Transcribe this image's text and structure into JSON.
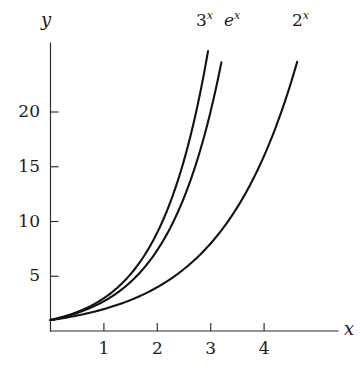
{
  "chart_data": {
    "type": "line",
    "title": "",
    "xlabel": "x",
    "ylabel": "y",
    "xlim": [
      0,
      5.4
    ],
    "ylim": [
      0,
      26.5
    ],
    "grid": false,
    "legend": "inline-curve-labels",
    "x_ticks": [
      1,
      2,
      3,
      4
    ],
    "x_tick_labels": [
      "1",
      "2",
      "3",
      "4"
    ],
    "y_ticks": [
      5,
      10,
      15,
      20
    ],
    "y_tick_labels": [
      "5",
      "10",
      "15",
      "20"
    ],
    "series": [
      {
        "name": "3^x",
        "label_base": "3",
        "label_exponent": "x",
        "label_italic_base": false,
        "function": "y = 3^x",
        "base": 3,
        "x": [
          0,
          0.25,
          0.5,
          0.75,
          1,
          1.25,
          1.5,
          1.75,
          2,
          2.25,
          2.5,
          2.75,
          2.95
        ],
        "values": [
          1,
          1.32,
          1.73,
          2.28,
          3,
          3.95,
          5.2,
          6.84,
          9,
          11.84,
          15.59,
          20.52,
          24.55
        ]
      },
      {
        "name": "e^x",
        "label_base": "e",
        "label_exponent": "x",
        "label_italic_base": true,
        "function": "y = e^x",
        "base": 2.718281828,
        "x": [
          0,
          0.25,
          0.5,
          0.75,
          1,
          1.25,
          1.5,
          1.75,
          2,
          2.25,
          2.5,
          2.75,
          3,
          3.2
        ],
        "values": [
          1,
          1.28,
          1.65,
          2.12,
          2.72,
          3.49,
          4.48,
          5.75,
          7.39,
          9.49,
          12.18,
          15.64,
          20.09,
          24.53
        ]
      },
      {
        "name": "2^x",
        "label_base": "2",
        "label_exponent": "x",
        "label_italic_base": false,
        "function": "y = 2^x",
        "base": 2,
        "x": [
          0,
          0.5,
          1,
          1.5,
          2,
          2.5,
          3,
          3.5,
          4,
          4.25,
          4.5,
          4.62
        ],
        "values": [
          1,
          1.41,
          2,
          2.83,
          4,
          5.66,
          8,
          11.31,
          16,
          19.03,
          22.63,
          24.59
        ]
      }
    ]
  },
  "axes": {
    "y_label": "y",
    "x_label": "x"
  },
  "colors": {
    "curve": "#121212",
    "axis": "#2b2b2b",
    "text": "#1a1a1a",
    "background": "#ffffff"
  },
  "geometry": {
    "origin_x_px": 50.5,
    "origin_y_px": 331,
    "x_unit_px": 53.4,
    "y_unit_px": 10.95,
    "y_axis_top_px": 43,
    "x_axis_right_px": 338
  }
}
